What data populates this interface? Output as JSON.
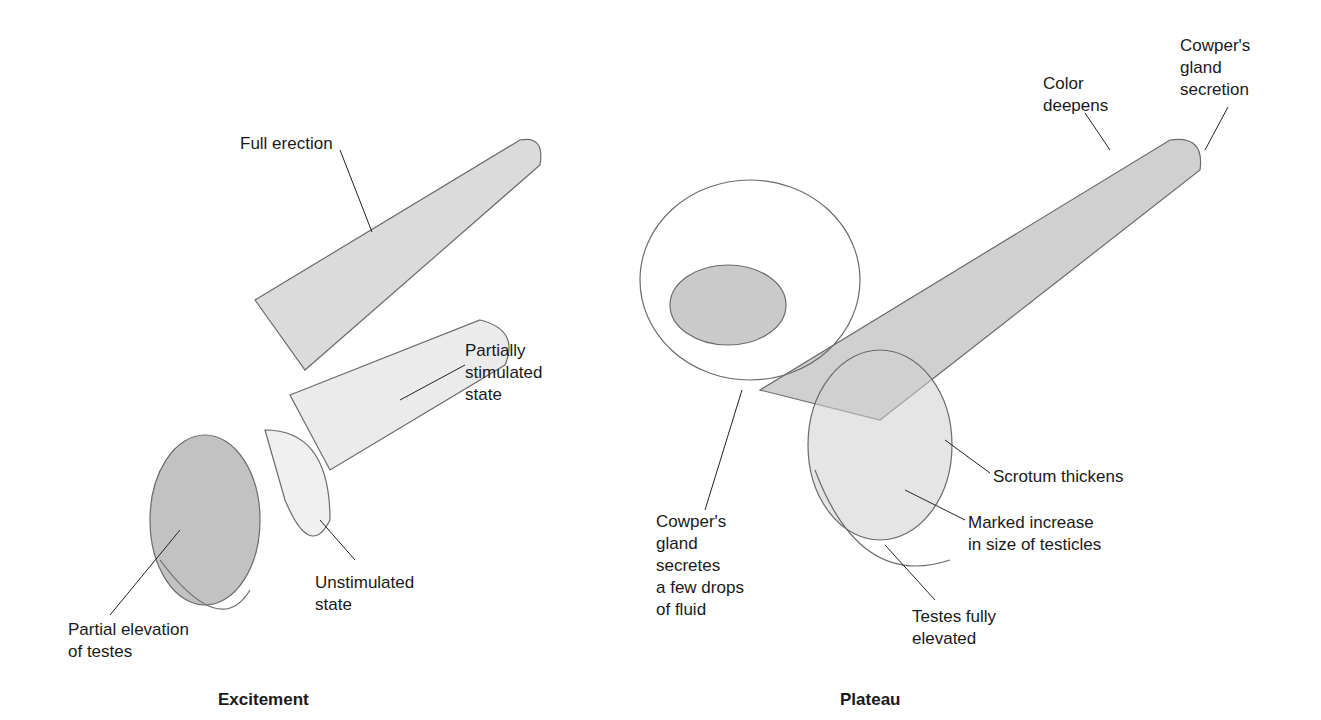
{
  "panels": [
    {
      "title": "Excitement",
      "labels": [
        {
          "text": "Full erection",
          "x": 240,
          "y": 133
        },
        {
          "text": "Partially\nstimulated\nstate",
          "x": 465,
          "y": 340
        },
        {
          "text": "Unstimulated\nstate",
          "x": 315,
          "y": 572
        },
        {
          "text": "Partial elevation\nof testes",
          "x": 68,
          "y": 619
        }
      ]
    },
    {
      "title": "Plateau",
      "labels": [
        {
          "text": "Color\ndeepens",
          "x": 1043,
          "y": 73
        },
        {
          "text": "Cowper's\ngland\nsecretion",
          "x": 1180,
          "y": 35
        },
        {
          "text": "Scrotum thickens",
          "x": 993,
          "y": 466
        },
        {
          "text": "Marked increase\nin size of testicles",
          "x": 968,
          "y": 512
        },
        {
          "text": "Cowper's\ngland\nsecretes\na few drops\nof fluid",
          "x": 656,
          "y": 511
        },
        {
          "text": "Testes fully\nelevated",
          "x": 912,
          "y": 606
        }
      ]
    }
  ]
}
